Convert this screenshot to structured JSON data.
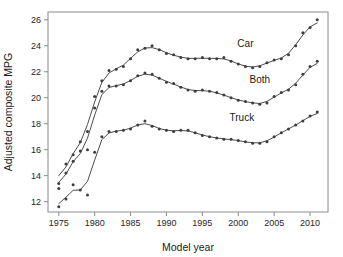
{
  "chart_data": {
    "type": "line",
    "title": "",
    "xlabel": "Model year",
    "ylabel": "Adjusted composite MPG",
    "xlim": [
      1973.5,
      2012.5
    ],
    "ylim": [
      11.2,
      26.6
    ],
    "xticks": [
      1975,
      1980,
      1985,
      1990,
      1995,
      2000,
      2005,
      2010
    ],
    "yticks": [
      12,
      14,
      16,
      18,
      20,
      22,
      24,
      26
    ],
    "grid": false,
    "legend_position": "inline-annotation",
    "point_color": "#3d3d3d",
    "line_color": "#4d4d4d",
    "axis_color": "#8c8c8c",
    "series": [
      {
        "name": "Car",
        "label": "Car",
        "label_x": 2001.0,
        "label_y": 23.9,
        "x": [
          1975,
          1976,
          1977,
          1978,
          1979,
          1980,
          1981,
          1982,
          1983,
          1984,
          1985,
          1986,
          1987,
          1988,
          1989,
          1990,
          1991,
          1992,
          1993,
          1994,
          1995,
          1996,
          1997,
          1998,
          1999,
          2000,
          2001,
          2002,
          2003,
          2004,
          2005,
          2006,
          2007,
          2008,
          2009,
          2010,
          2011
        ],
        "y": [
          13.4,
          14.9,
          15.6,
          16.6,
          17.4,
          20.1,
          21.3,
          22.1,
          22.2,
          22.4,
          23.0,
          23.7,
          23.8,
          24.0,
          23.7,
          23.4,
          23.3,
          23.1,
          23.0,
          23.0,
          23.1,
          23.0,
          23.0,
          23.1,
          22.8,
          22.6,
          22.4,
          22.3,
          22.4,
          22.7,
          22.9,
          23.0,
          23.3,
          24.0,
          25.0,
          25.4,
          26.0
        ]
      },
      {
        "name": "Both",
        "label": "Both",
        "label_x": 2003.0,
        "label_y": 21.1,
        "x": [
          1975,
          1976,
          1977,
          1978,
          1979,
          1980,
          1981,
          1982,
          1983,
          1984,
          1985,
          1986,
          1987,
          1988,
          1989,
          1990,
          1991,
          1992,
          1993,
          1994,
          1995,
          1996,
          1997,
          1998,
          1999,
          2000,
          2001,
          2002,
          2003,
          2004,
          2005,
          2006,
          2007,
          2008,
          2009,
          2010,
          2011
        ],
        "y": [
          13.0,
          14.2,
          15.1,
          15.9,
          16.0,
          19.2,
          20.5,
          20.9,
          20.9,
          21.0,
          21.3,
          21.7,
          21.9,
          21.8,
          21.5,
          21.2,
          21.1,
          20.8,
          20.6,
          20.5,
          20.6,
          20.5,
          20.4,
          20.2,
          20.0,
          19.8,
          19.7,
          19.6,
          19.5,
          19.6,
          20.1,
          20.4,
          20.6,
          21.0,
          21.8,
          22.4,
          22.8
        ]
      },
      {
        "name": "Truck",
        "label": "Truck",
        "label_x": 2000.5,
        "label_y": 18.2,
        "x": [
          1975,
          1976,
          1977,
          1978,
          1979,
          1980,
          1981,
          1982,
          1983,
          1984,
          1985,
          1986,
          1987,
          1988,
          1989,
          1990,
          1991,
          1992,
          1993,
          1994,
          1995,
          1996,
          1997,
          1998,
          1999,
          2000,
          2001,
          2002,
          2003,
          2004,
          2005,
          2006,
          2007,
          2008,
          2009,
          2010,
          2011
        ],
        "y": [
          11.6,
          12.2,
          13.3,
          12.9,
          12.5,
          15.8,
          17.0,
          17.4,
          17.4,
          17.5,
          17.6,
          17.9,
          18.2,
          17.8,
          17.6,
          17.5,
          17.4,
          17.5,
          17.5,
          17.3,
          17.1,
          17.0,
          16.9,
          16.8,
          16.8,
          16.7,
          16.6,
          16.5,
          16.5,
          16.6,
          17.0,
          17.3,
          17.6,
          17.9,
          18.2,
          18.6,
          18.9
        ]
      }
    ]
  },
  "axes": {
    "x_title": "Model year",
    "y_title": "Adjusted composite MPG",
    "x_tick_labels": [
      "1975",
      "1980",
      "1985",
      "1990",
      "1995",
      "2000",
      "2005",
      "2010"
    ],
    "y_tick_labels": [
      "12",
      "14",
      "16",
      "18",
      "20",
      "22",
      "24",
      "26"
    ]
  },
  "annotations": {
    "car": "Car",
    "both": "Both",
    "truck": "Truck"
  }
}
